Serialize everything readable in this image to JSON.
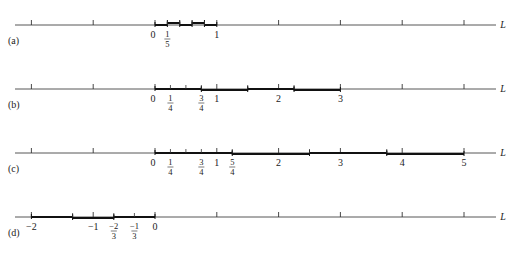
{
  "figure": {
    "axis_label": "L",
    "panels": [
      {
        "id": "a",
        "label": "(a)",
        "tick_labels": [
          {
            "text": "0",
            "value": 0
          },
          {
            "num": "1",
            "den": "5",
            "value": 0.2
          },
          {
            "text": "1",
            "value": 1
          }
        ],
        "segments": [
          [
            0,
            0.2
          ],
          [
            0.2,
            0.4
          ],
          [
            0.4,
            0.6
          ],
          [
            0.6,
            0.8
          ],
          [
            0.8,
            1.0
          ]
        ],
        "minor_ticks": [
          0.2,
          0.4,
          0.6,
          0.8
        ]
      },
      {
        "id": "b",
        "label": "(b)",
        "tick_labels": [
          {
            "text": "0",
            "value": 0
          },
          {
            "num": "1",
            "den": "4",
            "value": 0.25
          },
          {
            "num": "3",
            "den": "4",
            "value": 0.75
          },
          {
            "text": "1",
            "value": 1
          },
          {
            "text": "2",
            "value": 2
          },
          {
            "text": "3",
            "value": 3
          }
        ],
        "segments": [
          [
            0,
            0.75
          ],
          [
            0.75,
            1.5
          ],
          [
            1.5,
            2.25
          ],
          [
            2.25,
            3
          ]
        ],
        "minor_ticks": [
          0.25,
          0.5,
          0.75,
          1.5,
          2.25
        ]
      },
      {
        "id": "c",
        "label": "(c)",
        "tick_labels": [
          {
            "text": "0",
            "value": 0
          },
          {
            "num": "1",
            "den": "4",
            "value": 0.25
          },
          {
            "num": "3",
            "den": "4",
            "value": 0.75
          },
          {
            "text": "1",
            "value": 1
          },
          {
            "num": "5",
            "den": "4",
            "value": 1.25
          },
          {
            "text": "2",
            "value": 2
          },
          {
            "text": "3",
            "value": 3
          },
          {
            "text": "4",
            "value": 4
          },
          {
            "text": "5",
            "value": 5
          }
        ],
        "segments": [
          [
            0,
            1.25
          ],
          [
            1.25,
            2.5
          ],
          [
            2.5,
            3.75
          ],
          [
            3.75,
            5
          ]
        ],
        "minor_ticks": [
          0.25,
          0.5,
          0.75,
          1.25,
          2.5,
          3.75
        ]
      },
      {
        "id": "d",
        "label": "(d)",
        "tick_labels": [
          {
            "text": "−2",
            "value": -2
          },
          {
            "text": "−1",
            "value": -1
          },
          {
            "num": "−2",
            "den": "3",
            "value": -0.6667
          },
          {
            "num": "−1",
            "den": "3",
            "value": -0.3333
          },
          {
            "text": "0",
            "value": 0
          }
        ],
        "segments": [
          [
            -2,
            -1.3333
          ],
          [
            -1.3333,
            -0.6667
          ],
          [
            -0.6667,
            0
          ]
        ],
        "minor_ticks": [
          -1.3333,
          -0.6667,
          -0.3333
        ]
      }
    ]
  }
}
